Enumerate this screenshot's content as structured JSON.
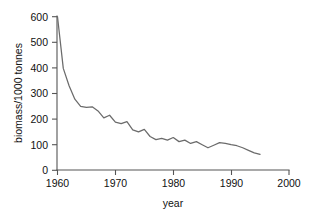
{
  "chart_data": {
    "type": "line",
    "title": "",
    "xlabel": "year",
    "ylabel": "biomass/1000 tonnes",
    "xlim": [
      1960,
      2000
    ],
    "ylim": [
      0,
      600
    ],
    "xticks": [
      1960,
      1970,
      1980,
      1990,
      2000
    ],
    "xtick_labels": [
      "1960",
      "1970",
      "1980",
      "1990",
      "2000"
    ],
    "yticks": [
      0,
      100,
      200,
      300,
      400,
      500,
      600
    ],
    "ytick_labels": [
      "0",
      "100",
      "200",
      "300",
      "400",
      "500",
      "600"
    ],
    "grid": false,
    "legend": null,
    "line_color": "#6b6b6b",
    "axis_color": "#555555",
    "background_color": "#ffffff",
    "series": [
      {
        "name": "biomass",
        "x": [
          1960,
          1961,
          1962,
          1963,
          1964,
          1965,
          1966,
          1967,
          1968,
          1969,
          1970,
          1971,
          1972,
          1973,
          1974,
          1975,
          1976,
          1977,
          1978,
          1979,
          1980,
          1981,
          1982,
          1983,
          1984,
          1985,
          1986,
          1987,
          1988,
          1989,
          1990,
          1991,
          1992,
          1993,
          1994,
          1995
        ],
        "values": [
          600,
          398,
          330,
          278,
          250,
          246,
          248,
          232,
          205,
          215,
          188,
          182,
          190,
          158,
          150,
          160,
          132,
          120,
          125,
          118,
          128,
          112,
          118,
          105,
          112,
          100,
          88,
          98,
          108,
          105,
          100,
          96,
          88,
          78,
          68,
          62
        ]
      }
    ],
    "annotations": []
  },
  "axis_labels": {
    "x_title": "year",
    "y_title": "biomass/1000 tonnes"
  }
}
